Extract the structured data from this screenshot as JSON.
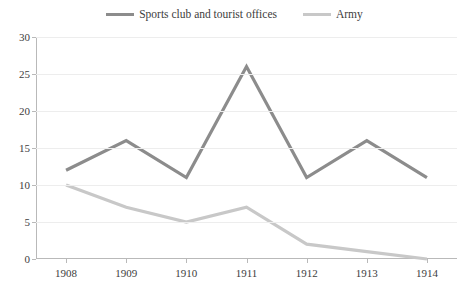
{
  "chart_data": {
    "type": "line",
    "title": "",
    "xlabel": "",
    "ylabel": "",
    "categories": [
      "1908",
      "1909",
      "1910",
      "1911",
      "1912",
      "1913",
      "1914"
    ],
    "x": [
      1908,
      1909,
      1910,
      1911,
      1912,
      1913,
      1914
    ],
    "series": [
      {
        "name": "Sports club and tourist offices",
        "color": "#8c8c8c",
        "values": [
          12,
          16,
          11,
          26,
          11,
          16,
          11
        ]
      },
      {
        "name": "Army",
        "color": "#c8c8c8",
        "values": [
          10,
          7,
          5,
          7,
          2,
          1,
          0
        ]
      }
    ],
    "ylim": [
      0,
      30
    ],
    "ytick_step": 5,
    "yticks": [
      0,
      5,
      10,
      15,
      20,
      25,
      30
    ],
    "ytick_labels": [
      "0",
      "5",
      "10",
      "15",
      "20",
      "25",
      "30"
    ],
    "grid": true,
    "grid_axis": "y",
    "legend_position": "top-center"
  },
  "legend": {
    "items": [
      {
        "label": "Sports club and tourist offices",
        "color": "#8c8c8c"
      },
      {
        "label": "Army",
        "color": "#c8c8c8"
      }
    ]
  },
  "colors": {
    "background": "#ffffff",
    "axis": "#b9b9b9",
    "grid": "#ededed",
    "text": "#3d3d3d",
    "series_dark": "#8c8c8c",
    "series_light": "#c8c8c8"
  }
}
